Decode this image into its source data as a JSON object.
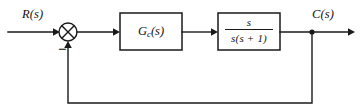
{
  "diagram": {
    "type": "control-system-block-diagram",
    "background_color": "#ffffff",
    "line_color": "#1a1a1a",
    "signals": {
      "input_label": "R(s)",
      "output_label": "C(s)"
    },
    "summing_junction": {
      "name": "summing-junction",
      "style": "circle-with-cross",
      "input_sign_reference": "+",
      "feedback_sign": "−",
      "center_x": 68,
      "center_y": 32,
      "radius": 9
    },
    "blocks": [
      {
        "id": "controller",
        "name": "controller-block",
        "label": "G",
        "subscript": "c",
        "label_suffix": "(s)",
        "full_label": "Gc(s)",
        "x": 120,
        "y": 13,
        "width": 62,
        "height": 37
      },
      {
        "id": "plant",
        "name": "plant-block",
        "numerator": "s",
        "denominator": "s(s + 1)",
        "full_label": "s / (s(s + 1))",
        "x": 218,
        "y": 13,
        "width": 62,
        "height": 37
      }
    ],
    "pickoff_point": {
      "name": "pickoff-node",
      "x": 312,
      "y": 32
    },
    "feedback_path": {
      "name": "feedback-wire",
      "bottom_y": 103,
      "from_x": 312,
      "to_x": 68,
      "direction": "right-to-left-then-up"
    },
    "main_line_y": 32
  }
}
